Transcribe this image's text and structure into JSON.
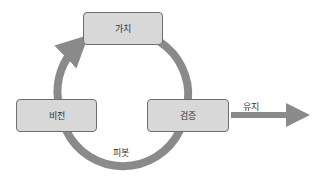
{
  "diagram": {
    "type": "cycle",
    "colors": {
      "node_fill": "#d8d8d8",
      "node_border": "#6e6e6e",
      "arrow": "#8a8a8a",
      "text": "#333333"
    },
    "nodes": [
      {
        "id": "value",
        "label": "가치"
      },
      {
        "id": "vision",
        "label": "비전"
      },
      {
        "id": "validation",
        "label": "검증"
      }
    ],
    "edges": [
      {
        "from": "vision",
        "to": "value",
        "label": ""
      },
      {
        "from": "value",
        "to": "validation",
        "label": ""
      },
      {
        "from": "validation",
        "to": "vision",
        "label": "피봇"
      },
      {
        "from": "validation",
        "to": "exit",
        "label": "유지"
      }
    ],
    "labels": {
      "pivot": "피봇",
      "persevere": "유지"
    }
  }
}
